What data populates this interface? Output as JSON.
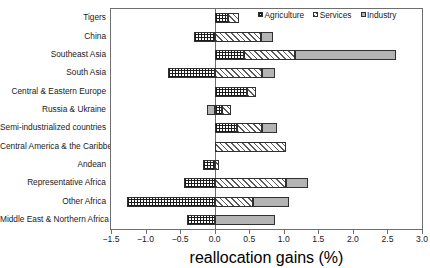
{
  "chart_data": {
    "type": "bar",
    "orientation": "horizontal",
    "stacked": true,
    "title": "",
    "xlabel": "reallocation gains (%)",
    "ylabel": "",
    "xlim": [
      -1.5,
      3.0
    ],
    "xticks": [
      -1.5,
      -1.0,
      -0.5,
      0.0,
      0.5,
      1.0,
      1.5,
      2.0,
      2.5,
      3.0
    ],
    "xticklabels": [
      "-1.5",
      "-1.0",
      "-0.5",
      "0.0",
      "0.5",
      "1.0",
      "1.5",
      "2.0",
      "2.5",
      "3.0"
    ],
    "grid": false,
    "legend_position": "top-right",
    "legend": [
      "Agriculture",
      "Services",
      "Industry"
    ],
    "categories": [
      "Tigers",
      "China",
      "Southeast Asia",
      "South Asia",
      "Central & Eastern Europe",
      "Russia & Ukraine",
      "Semi-industrialized countries",
      "Central America & the Caribbean",
      "Andean",
      "Representative Africa",
      "Other Africa",
      "Middle East & Northern Africa"
    ],
    "series": [
      {
        "name": "Agriculture",
        "color": "#ffffff",
        "hatch": "cross-hatch",
        "values": [
          0.19,
          -0.3,
          0.43,
          -0.68,
          0.47,
          0.11,
          0.33,
          0.0,
          -0.17,
          -0.44,
          -1.27,
          -0.4
        ]
      },
      {
        "name": "Services",
        "color": "#ffffff",
        "hatch": "diagonal-hatch",
        "values": [
          0.16,
          0.67,
          0.73,
          0.68,
          0.13,
          0.13,
          0.35,
          1.03,
          0.06,
          1.03,
          0.56,
          0.0
        ]
      },
      {
        "name": "Industry",
        "color": "#b4b4b4",
        "hatch": "solid",
        "values": [
          0.0,
          0.17,
          1.46,
          0.19,
          0.0,
          -0.11,
          0.22,
          0.0,
          0.0,
          0.32,
          0.51,
          0.88
        ]
      }
    ],
    "totals": [
      0.35,
      0.54,
      2.62,
      0.19,
      0.6,
      0.13,
      0.9,
      1.03,
      -0.11,
      0.91,
      -0.2,
      0.48
    ]
  }
}
